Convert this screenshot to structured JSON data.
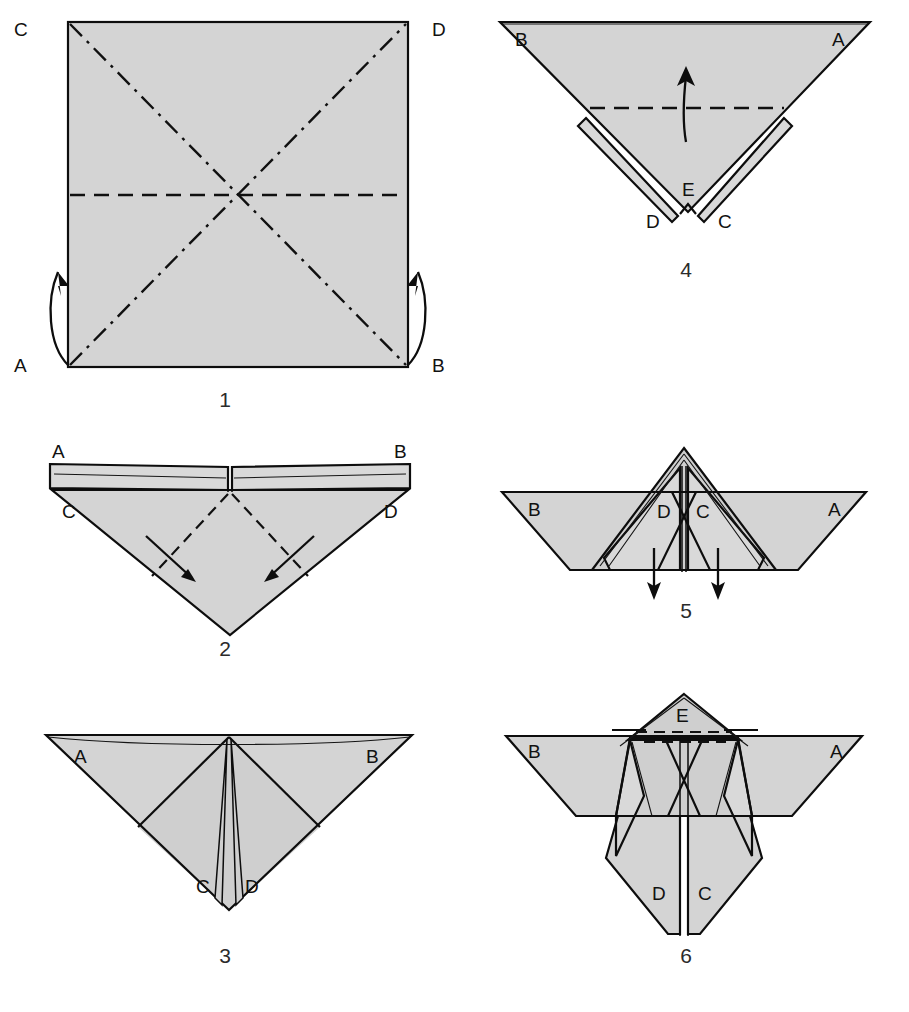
{
  "document": {
    "kind": "origami-folding-instructions",
    "background_color": "#ffffff",
    "paper_color": "#d4d4d4",
    "ink_color": "#0d0d0d",
    "width": 909,
    "height": 1012
  },
  "legend": {
    "valley_fold": "dashed line",
    "mountain_fold": "dash-dot line",
    "fold_direction": "arrow"
  },
  "steps": [
    {
      "number": "1",
      "caption_position": {
        "x": 225,
        "y": 386
      },
      "shape": "square",
      "labels": [
        {
          "text": "C",
          "x": 14,
          "y": 36,
          "corner": "top-left"
        },
        {
          "text": "D",
          "x": 432,
          "y": 36,
          "corner": "top-right"
        },
        {
          "text": "A",
          "x": 14,
          "y": 372,
          "corner": "bottom-left"
        },
        {
          "text": "B",
          "x": 432,
          "y": 372,
          "corner": "bottom-right"
        }
      ],
      "creases": [
        {
          "type": "mountain",
          "from": "C",
          "to": "B"
        },
        {
          "type": "mountain",
          "from": "A",
          "to": "D"
        },
        {
          "type": "valley",
          "from": "left-mid",
          "to": "right-mid"
        }
      ],
      "arrows": [
        {
          "name": "fold-arrow-left",
          "direction": "up-curved"
        },
        {
          "name": "fold-arrow-right",
          "direction": "up-curved"
        }
      ]
    },
    {
      "number": "2",
      "caption_position": {
        "x": 225,
        "y": 655
      },
      "shape": "inverted-triangle-with-top-flap",
      "labels": [
        {
          "text": "A",
          "x": 52,
          "y": 460,
          "corner": "top-left"
        },
        {
          "text": "B",
          "x": 396,
          "y": 460,
          "corner": "top-right"
        },
        {
          "text": "C",
          "x": 62,
          "y": 500,
          "corner": "inner-left"
        },
        {
          "text": "D",
          "x": 388,
          "y": 500,
          "corner": "inner-right"
        }
      ],
      "creases": [
        {
          "type": "valley",
          "side": "left"
        },
        {
          "type": "valley",
          "side": "right"
        }
      ],
      "arrows": [
        {
          "name": "fold-arrow-left",
          "direction": "down-right"
        },
        {
          "name": "fold-arrow-right",
          "direction": "down-left"
        }
      ]
    },
    {
      "number": "3",
      "caption_position": {
        "x": 225,
        "y": 962
      },
      "shape": "inverted-triangle-with-center-points",
      "labels": [
        {
          "text": "A",
          "x": 74,
          "y": 748,
          "corner": "top-left"
        },
        {
          "text": "B",
          "x": 368,
          "y": 748,
          "corner": "top-right"
        },
        {
          "text": "C",
          "x": 198,
          "y": 893,
          "corner": "center-left-point"
        },
        {
          "text": "D",
          "x": 245,
          "y": 893,
          "corner": "center-right-point"
        }
      ],
      "creases": [],
      "arrows": []
    },
    {
      "number": "4",
      "caption_position": {
        "x": 686,
        "y": 276
      },
      "shape": "inverted-triangle-with-split-tip",
      "labels": [
        {
          "text": "B",
          "x": 515,
          "y": 46,
          "corner": "top-left"
        },
        {
          "text": "A",
          "x": 832,
          "y": 46,
          "corner": "top-right"
        },
        {
          "text": "E",
          "x": 683,
          "y": 196,
          "corner": "center-tip"
        },
        {
          "text": "D",
          "x": 646,
          "y": 218,
          "corner": "left-tip"
        },
        {
          "text": "C",
          "x": 719,
          "y": 218,
          "corner": "right-tip"
        }
      ],
      "creases": [
        {
          "type": "valley",
          "orientation": "horizontal"
        }
      ],
      "arrows": [
        {
          "name": "fold-up-arrow",
          "direction": "up"
        }
      ]
    },
    {
      "number": "5",
      "caption_position": {
        "x": 686,
        "y": 617
      },
      "shape": "bird-base-with-wings",
      "labels": [
        {
          "text": "B",
          "x": 531,
          "y": 504,
          "corner": "left-wing"
        },
        {
          "text": "D",
          "x": 660,
          "y": 506,
          "corner": "center-left"
        },
        {
          "text": "C",
          "x": 700,
          "y": 506,
          "corner": "center-right"
        },
        {
          "text": "A",
          "x": 833,
          "y": 504,
          "corner": "right-wing"
        }
      ],
      "creases": [],
      "arrows": [
        {
          "name": "pull-down-arrow-left",
          "direction": "down"
        },
        {
          "name": "pull-down-arrow-right",
          "direction": "down"
        }
      ]
    },
    {
      "number": "6",
      "caption_position": {
        "x": 686,
        "y": 962
      },
      "shape": "bird-with-legs",
      "labels": [
        {
          "text": "E",
          "x": 690,
          "y": 715,
          "corner": "head"
        },
        {
          "text": "B",
          "x": 534,
          "y": 750,
          "corner": "left-wing"
        },
        {
          "text": "A",
          "x": 834,
          "y": 750,
          "corner": "right-wing"
        },
        {
          "text": "D",
          "x": 655,
          "y": 895,
          "corner": "left-leg"
        },
        {
          "text": "C",
          "x": 700,
          "y": 895,
          "corner": "right-leg"
        }
      ],
      "creases": [
        {
          "type": "valley",
          "orientation": "horizontal-crimp"
        }
      ],
      "arrows": []
    }
  ]
}
